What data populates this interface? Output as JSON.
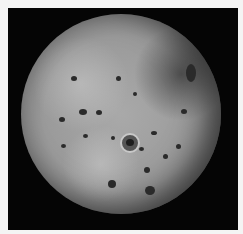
{
  "image": {
    "subject": "Io (moon of Jupiter), grayscale photograph",
    "background_color": "#050505",
    "border_color": "#f4f4f4",
    "surface_color": "#a0a0a0"
  },
  "spots": [
    {
      "x": 50,
      "y": 62,
      "w": 6,
      "h": 5
    },
    {
      "x": 38,
      "y": 103,
      "w": 6,
      "h": 5
    },
    {
      "x": 58,
      "y": 95,
      "w": 8,
      "h": 6
    },
    {
      "x": 75,
      "y": 96,
      "w": 6,
      "h": 5
    },
    {
      "x": 62,
      "y": 120,
      "w": 5,
      "h": 4
    },
    {
      "x": 90,
      "y": 122,
      "w": 4,
      "h": 4
    },
    {
      "x": 130,
      "y": 117,
      "w": 6,
      "h": 4
    },
    {
      "x": 118,
      "y": 133,
      "w": 5,
      "h": 4
    },
    {
      "x": 142,
      "y": 140,
      "w": 5,
      "h": 5
    },
    {
      "x": 40,
      "y": 130,
      "w": 5,
      "h": 4
    },
    {
      "x": 123,
      "y": 153,
      "w": 6,
      "h": 6
    },
    {
      "x": 124,
      "y": 172,
      "w": 10,
      "h": 9
    },
    {
      "x": 87,
      "y": 166,
      "w": 8,
      "h": 8
    },
    {
      "x": 160,
      "y": 95,
      "w": 6,
      "h": 5
    },
    {
      "x": 155,
      "y": 130,
      "w": 5,
      "h": 5
    },
    {
      "x": 165,
      "y": 50,
      "w": 10,
      "h": 18
    },
    {
      "x": 95,
      "y": 62,
      "w": 5,
      "h": 5
    },
    {
      "x": 112,
      "y": 78,
      "w": 4,
      "h": 4
    }
  ],
  "crater": {
    "x": 99,
    "y": 119
  }
}
